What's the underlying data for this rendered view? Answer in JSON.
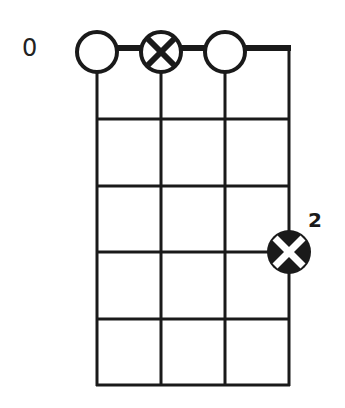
{
  "diagram": {
    "type": "chord-chart",
    "starting_fret_label": "0",
    "strings": 4,
    "frets": 5,
    "open_strings": [
      {
        "string": 1,
        "marker": "open-circle"
      },
      {
        "string": 2,
        "marker": "x-circle"
      },
      {
        "string": 3,
        "marker": "open-circle"
      }
    ],
    "fretted_notes": [
      {
        "string": 4,
        "fret": 4,
        "marker": "filled-x-circle",
        "finger": "2"
      }
    ],
    "colors": {
      "line": "#1a1a1a",
      "background": "#ffffff"
    }
  }
}
